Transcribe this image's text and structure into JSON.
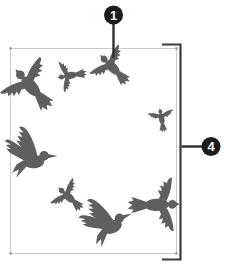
{
  "diagram": {
    "callouts": [
      {
        "label": "1",
        "points_to": "bird-silhouette-top-center"
      },
      {
        "label": "4",
        "points_to": "right-side-height-bracket"
      }
    ],
    "birds_count": 8,
    "birds": [
      {
        "name": "bird-silhouette-large-left",
        "variant": "bird-soaring",
        "x": 34,
        "y": 90,
        "rotate": -42,
        "scale": 0.58
      },
      {
        "name": "bird-silhouette-small-upper",
        "variant": "bird-soaring",
        "x": 73,
        "y": 75,
        "rotate": -100,
        "scale": 0.33
      },
      {
        "name": "bird-silhouette-top-center",
        "variant": "bird-soaring",
        "x": 115,
        "y": 70,
        "rotate": -45,
        "scale": 0.44
      },
      {
        "name": "bird-silhouette-small-right",
        "variant": "bird-soaring",
        "x": 162,
        "y": 121,
        "rotate": -10,
        "scale": 0.27
      },
      {
        "name": "bird-silhouette-mid-left",
        "variant": "bird-flapping",
        "x": 30,
        "y": 157,
        "rotate": -5,
        "scale": 0.64
      },
      {
        "name": "bird-silhouette-center",
        "variant": "bird-soaring",
        "x": 71,
        "y": 199,
        "rotate": -48,
        "scale": 0.36
      },
      {
        "name": "bird-silhouette-bottom-center",
        "variant": "bird-flapping",
        "x": 107,
        "y": 224,
        "rotate": -25,
        "scale": 0.62
      },
      {
        "name": "bird-silhouette-large-right",
        "variant": "bird-soaring",
        "x": 152,
        "y": 205,
        "rotate": 88,
        "scale": 0.58
      }
    ],
    "colors": {
      "background": "#ffffff",
      "bird_color": "#5f5f5f",
      "frame_border": "#c9c9c9",
      "corner_dot": "#9c9c9c",
      "bracket_color": "#3a3a3a",
      "leader_color": "#2e2e2e",
      "callout_bg": "#1c1c1c",
      "callout_text": "#ffffff"
    }
  }
}
